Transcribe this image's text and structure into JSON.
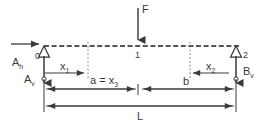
{
  "diagram": {
    "colors": {
      "line": "#3a3a3a",
      "dashed_beam": "#555555",
      "dotted_guide": "#777777",
      "background": "#ffffff"
    },
    "labels": {
      "force": "F",
      "node_left": "0",
      "node_mid": "1",
      "node_right": "2",
      "reaction_horizontal": "A",
      "reaction_horizontal_sub": "h",
      "reaction_vertical_left": "A",
      "reaction_vertical_left_sub": "v",
      "reaction_vertical_right": "B",
      "reaction_vertical_right_sub": "v",
      "dim_x1": "x",
      "dim_x1_sub": "1",
      "dim_x2": "x",
      "dim_x2_sub": "2",
      "dim_a": "a = x",
      "dim_a_sub": "3",
      "dim_b": "b",
      "dim_length": "L"
    },
    "elements": [
      {
        "name": "force-arrow-F",
        "type": "arrow-down",
        "x": 138,
        "y_start": 8,
        "y_end": 46
      },
      {
        "name": "reaction-arrow-Ah",
        "type": "arrow-right",
        "y": 44,
        "x_start": 12,
        "x_end": 42
      },
      {
        "name": "reaction-arrow-Av",
        "type": "arrow-up",
        "x": 44,
        "y_start": 82,
        "y_end": 52
      },
      {
        "name": "reaction-arrow-Bv",
        "type": "arrow-up",
        "x": 229,
        "y_start": 82,
        "y_end": 52
      },
      {
        "name": "support-triangle-left",
        "type": "pin-support",
        "x": 44,
        "y": 48
      },
      {
        "name": "support-triangle-right",
        "type": "pin-support",
        "x": 229,
        "y": 48
      },
      {
        "name": "beam-dashed-line",
        "type": "dashed",
        "x_start": 44,
        "x_end": 241,
        "y": 46
      },
      {
        "name": "guide-dotted-a",
        "type": "dotted-vertical",
        "x": 88,
        "y_start": 44,
        "y_end": 80
      },
      {
        "name": "guide-dotted-b",
        "type": "dotted-vertical",
        "x": 190,
        "y_start": 44,
        "y_end": 80
      },
      {
        "name": "dimension-x1",
        "type": "dim-right",
        "y": 66,
        "x_start": 44,
        "x_end": 88
      },
      {
        "name": "dimension-x2",
        "type": "dim-left",
        "y": 70,
        "x_start": 229,
        "x_end": 190
      },
      {
        "name": "dimension-a",
        "type": "dim-both",
        "y": 89,
        "x_start": 44,
        "x_end": 138
      },
      {
        "name": "dimension-b",
        "type": "dim-both",
        "y": 89,
        "x_start": 138,
        "x_end": 229
      },
      {
        "name": "dimension-L",
        "type": "dim-both",
        "y": 105,
        "x_start": 44,
        "x_end": 229
      }
    ]
  }
}
